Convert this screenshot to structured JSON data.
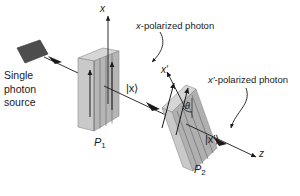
{
  "figure": {
    "type": "physics-diagram",
    "background_color": "#ffffff",
    "ink_color": "#1a1a1a"
  },
  "source": {
    "label_line1": "Single",
    "label_line2": "photon",
    "label_line3": "source",
    "shape": "tilted-square-emitter",
    "fill_color": "#4d4d4d"
  },
  "annotations": {
    "x_polarized": "x-polarized photon",
    "xprime_polarized": "x′-polarized photon"
  },
  "axes": {
    "x": "x",
    "x_prime": "x′",
    "z": "z"
  },
  "states": {
    "ket_x": "|x⟩",
    "ket_x_prime": "|x′⟩"
  },
  "polarizers": [
    {
      "id": "P1",
      "label": "P",
      "subscript": "1",
      "orientation": "vertical",
      "face_color": "#a8a8a8",
      "edge_color": "#cfcfcf"
    },
    {
      "id": "P2",
      "label": "P",
      "subscript": "2",
      "orientation": "tilted",
      "face_color": "#a8a8a8",
      "edge_color": "#cfcfcf"
    }
  ],
  "angle": {
    "symbol": "θ",
    "between": [
      "x",
      "x′"
    ]
  }
}
